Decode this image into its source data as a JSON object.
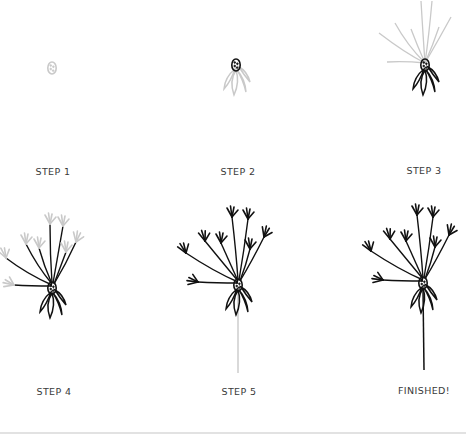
{
  "steps": [
    {
      "id": "step-1",
      "label": "STEP 1"
    },
    {
      "id": "step-2",
      "label": "STEP 2"
    },
    {
      "id": "step-3",
      "label": "STEP 3"
    },
    {
      "id": "step-4",
      "label": "STEP 4"
    },
    {
      "id": "step-5",
      "label": "STEP 5"
    },
    {
      "id": "finished",
      "label": "FINISHED!"
    }
  ],
  "colors": {
    "ink": "#111111",
    "guide": "#c9c9c9",
    "label": "#3a3a3a",
    "background": "#ffffff"
  }
}
